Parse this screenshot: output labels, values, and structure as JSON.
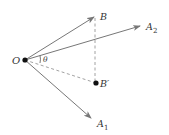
{
  "diagram": {
    "title": "",
    "colors": {
      "line": "#777777",
      "dash": "#8a8a8a",
      "point": "#111111",
      "text": "#333333"
    },
    "points": {
      "O": {
        "label": "O",
        "x": 25,
        "y": 60
      },
      "B": {
        "label": "B",
        "sub": "",
        "x": 94,
        "y": 17
      },
      "A2": {
        "label": "A",
        "sub": "2",
        "x": 140,
        "y": 26
      },
      "Bprime": {
        "label": "B′",
        "x": 96,
        "y": 83
      },
      "A1": {
        "label": "A",
        "sub": "1",
        "x": 91,
        "y": 118
      }
    },
    "angle_label": "θ",
    "edges": [
      {
        "from": "O",
        "to": "B",
        "style": "arrow"
      },
      {
        "from": "O",
        "to": "A2",
        "style": "arrow"
      },
      {
        "from": "O",
        "to": "A1",
        "style": "arrow"
      },
      {
        "from": "O",
        "to": "Bprime",
        "style": "dashed"
      },
      {
        "from": "B",
        "to": "Bprime",
        "style": "dashed"
      }
    ]
  }
}
